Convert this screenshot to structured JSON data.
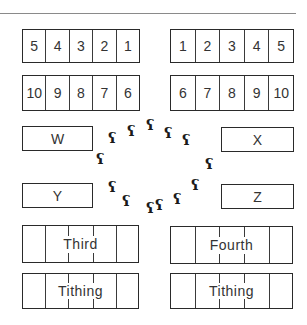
{
  "diagram": {
    "left_top_row": [
      "5",
      "4",
      "3",
      "2",
      "1"
    ],
    "left_bottom_row": [
      "10",
      "9",
      "8",
      "7",
      "6"
    ],
    "right_top_row": [
      "1",
      "2",
      "3",
      "4",
      "5"
    ],
    "right_bottom_row": [
      "6",
      "7",
      "8",
      "9",
      "10"
    ],
    "slots": {
      "w": "W",
      "x": "X",
      "y": "Y",
      "z": "Z"
    },
    "wide_boxes": {
      "left_upper": "Third",
      "left_lower": "Tithing",
      "right_upper": "Fourth",
      "right_lower": "Tithing"
    },
    "footprint_glyph": "ʕ",
    "footprint_count": 14
  }
}
